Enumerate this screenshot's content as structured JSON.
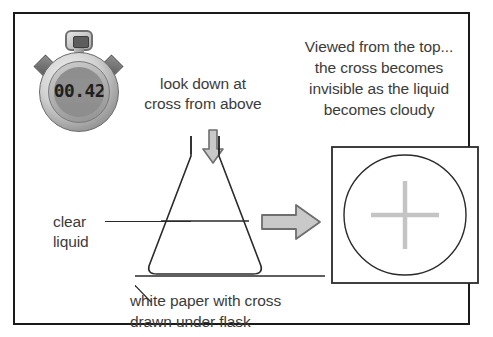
{
  "figure": {
    "background": "#ffffff",
    "frame_color": "#1a1a1a"
  },
  "stopwatch": {
    "name": "stopwatch",
    "display_value": "00.42",
    "body_color": "#9d9d9d",
    "lcd_color": "#909090",
    "digit_color": "#1f1f1f"
  },
  "labels": {
    "look_down": "look down at\ncross from above",
    "viewed_top": "Viewed from the top...\nthe cross becomes\ninvisible as the liquid\nbecomes cloudy",
    "clear_liquid": "clear\nliquid",
    "white_paper": "white paper with cross\ndrawn under flask",
    "text_color": "#3b3b3b"
  },
  "icons": {
    "arrow_down": "arrow-down-icon",
    "arrow_right": "arrow-right-icon",
    "flask": "conical-flask-icon",
    "cross": "cross-icon",
    "circle": "circle-icon"
  },
  "colors": {
    "line": "#2a2a2a",
    "arrow_fill": "#c9c9c9",
    "arrow_stroke": "#6e6e6e",
    "cross_faded": "#c4c4c4",
    "liquid_line": "#2a2a2a"
  }
}
